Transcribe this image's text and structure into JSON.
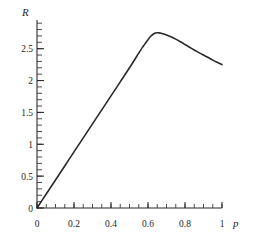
{
  "chart_data": {
    "type": "line",
    "title": "",
    "subtitle": "",
    "xlabel": "p",
    "ylabel": "R",
    "xlim": [
      0,
      1
    ],
    "ylim": [
      0,
      2.95
    ],
    "grid": false,
    "legend": null,
    "x_ticks": [
      {
        "value": 0,
        "label": "0"
      },
      {
        "value": 0.2,
        "label": "0.2"
      },
      {
        "value": 0.4,
        "label": "0.4"
      },
      {
        "value": 0.6,
        "label": "0.6"
      },
      {
        "value": 0.8,
        "label": "0.8"
      },
      {
        "value": 1,
        "label": "1"
      }
    ],
    "y_ticks": [
      {
        "value": 0,
        "label": "0"
      },
      {
        "value": 0.5,
        "label": "0.5"
      },
      {
        "value": 1,
        "label": "1"
      },
      {
        "value": 1.5,
        "label": "1.5"
      },
      {
        "value": 2,
        "label": "2"
      },
      {
        "value": 2.5,
        "label": "2.5"
      }
    ],
    "x_minor_tick_step": 0.05,
    "y_minor_tick_step": 0.1,
    "series": [
      {
        "name": "R(p)",
        "color": "#29292b",
        "x": [
          0.0,
          0.05,
          0.1,
          0.15,
          0.2,
          0.25,
          0.3,
          0.35,
          0.4,
          0.45,
          0.5,
          0.55,
          0.57,
          0.58,
          0.59,
          0.6,
          0.61,
          0.62,
          0.63,
          0.64,
          0.65,
          0.66,
          0.68,
          0.7,
          0.72,
          0.75,
          0.78,
          0.8,
          0.82,
          0.85,
          0.88,
          0.9,
          0.92,
          0.95,
          0.97,
          1.0
        ],
        "y": [
          0.0,
          0.22,
          0.44,
          0.66,
          0.88,
          1.1,
          1.32,
          1.54,
          1.76,
          1.98,
          2.2,
          2.43,
          2.52,
          2.56,
          2.6,
          2.64,
          2.68,
          2.71,
          2.73,
          2.745,
          2.75,
          2.748,
          2.735,
          2.715,
          2.69,
          2.65,
          2.6,
          2.565,
          2.53,
          2.48,
          2.43,
          2.4,
          2.37,
          2.32,
          2.29,
          2.25
        ]
      }
    ]
  },
  "axis_labels": {
    "y_axis_name": "R",
    "x_axis_name": "p"
  }
}
